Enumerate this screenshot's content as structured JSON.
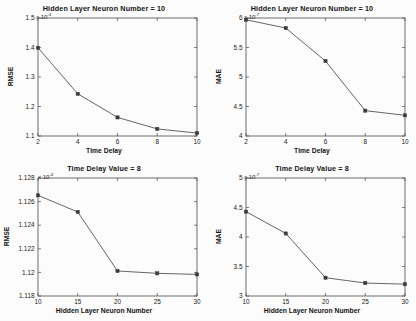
{
  "figure": {
    "background_color": "#fdfdfd",
    "line_color": "#555555",
    "marker_color": "#3a3a3a",
    "axis_color": "#4a4a4a"
  },
  "chart_data": [
    {
      "id": "top-left",
      "type": "line",
      "title": "Hidden Layer Neuron Number = 10",
      "xlabel": "Time Delay",
      "ylabel": "RMSE",
      "exponent_label": "x 10",
      "exponent_value": "-4",
      "x": [
        2,
        4,
        6,
        8,
        10
      ],
      "values": [
        1.399,
        1.243,
        1.163,
        1.124,
        1.11
      ],
      "xticks": [
        2,
        4,
        6,
        8,
        10
      ],
      "xticklabels": [
        "2",
        "4",
        "6",
        "8",
        "10"
      ],
      "yticks": [
        1.1,
        1.2,
        1.3,
        1.4,
        1.5
      ],
      "yticklabels": [
        "1.1",
        "1.2",
        "1.3",
        "1.4",
        "1.5"
      ],
      "xlim": [
        2,
        10
      ],
      "ylim": [
        1.1,
        1.5
      ],
      "grid": false,
      "legend": "none",
      "marker": "square"
    },
    {
      "id": "top-right",
      "type": "line",
      "title": "Hidden Layer Neuron Number = 10",
      "xlabel": "Time Delay",
      "ylabel": "MAE",
      "exponent_label": "x 10",
      "exponent_value": "-7",
      "x": [
        2,
        4,
        6,
        8,
        10
      ],
      "values": [
        5.97,
        5.83,
        5.27,
        4.43,
        4.35
      ],
      "xticks": [
        2,
        4,
        6,
        8,
        10
      ],
      "xticklabels": [
        "2",
        "4",
        "6",
        "8",
        "10"
      ],
      "yticks": [
        4,
        4.5,
        5,
        5.5,
        6
      ],
      "yticklabels": [
        "4",
        "4.5",
        "5",
        "5.5",
        "6"
      ],
      "xlim": [
        2,
        10
      ],
      "ylim": [
        4,
        6
      ],
      "grid": false,
      "legend": "none",
      "marker": "square"
    },
    {
      "id": "bottom-left",
      "type": "line",
      "title": "Time Delay Value = 8",
      "xlabel": "Hidden Layer Neuron Number",
      "ylabel": "RMSE",
      "exponent_label": "x 10",
      "exponent_value": "-4",
      "x": [
        10,
        15,
        20,
        25,
        30
      ],
      "values": [
        1.12653,
        1.12512,
        1.12012,
        1.11992,
        1.11983
      ],
      "xticks": [
        10,
        15,
        20,
        25,
        30
      ],
      "xticklabels": [
        "10",
        "15",
        "20",
        "25",
        "30"
      ],
      "yticks": [
        1.118,
        1.12,
        1.122,
        1.124,
        1.126,
        1.128
      ],
      "yticklabels": [
        "1.118",
        "1.12",
        "1.122",
        "1.124",
        "1.126",
        "1.128"
      ],
      "xlim": [
        10,
        30
      ],
      "ylim": [
        1.118,
        1.128
      ],
      "grid": false,
      "legend": "none",
      "marker": "square"
    },
    {
      "id": "bottom-right",
      "type": "line",
      "title": "Time Delay Value = 8",
      "xlabel": "Hidden Layer Neuron Number",
      "ylabel": "MAE",
      "exponent_label": "x 10",
      "exponent_value": "-7",
      "x": [
        10,
        15,
        20,
        25,
        30
      ],
      "values": [
        4.43,
        4.06,
        3.31,
        3.22,
        3.2
      ],
      "xticks": [
        10,
        15,
        20,
        25,
        30
      ],
      "xticklabels": [
        "10",
        "15",
        "20",
        "25",
        "30"
      ],
      "yticks": [
        3,
        3.5,
        4,
        4.5,
        5
      ],
      "yticklabels": [
        "3",
        "3.5",
        "4",
        "4.5",
        "5"
      ],
      "xlim": [
        3,
        5
      ],
      "ylim": [
        3,
        5
      ],
      "grid": false,
      "legend": "none",
      "marker": "square"
    }
  ]
}
